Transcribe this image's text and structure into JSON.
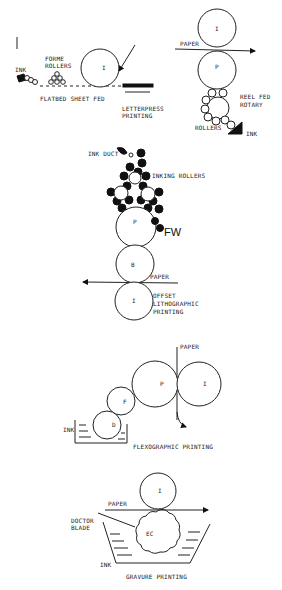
{
  "diagrams": {
    "letterpress": {
      "title_lines": [
        "LETTERPRESS",
        "PRINTING"
      ],
      "sub_label": "FLATBED SHEET FED",
      "ink_label": "INK",
      "forme_rollers_lines": [
        "FORME",
        "ROLLERS"
      ],
      "cylinder_label": "I"
    },
    "reel_fed": {
      "paper_label": "PAPER",
      "impression_label": "I",
      "plate_label": "P",
      "title_lines": [
        "REEL FED",
        "ROTARY"
      ],
      "rollers_label": "ROLLERS",
      "ink_label": "INK"
    },
    "offset": {
      "ink_duct_label": "INK DUCT",
      "inking_rollers_label": "INKING ROLLERS",
      "plate_label": "P",
      "fw_label": "FW",
      "blanket_label": "B",
      "paper_label": "PAPER",
      "impression_label": "I",
      "title_lines": [
        "OFFSET",
        "LITHOGRAPHIC",
        "PRINTING"
      ]
    },
    "flexographic": {
      "paper_label": "PAPER",
      "plate_label": "P",
      "impression_label": "I",
      "fountain_label": "F",
      "ductor_label": "D",
      "ink_label": "INK",
      "title": "FLEXOGRAPHIC PRINTING"
    },
    "gravure": {
      "impression_label": "I",
      "paper_label": "PAPER",
      "doctor_blade_lines": [
        "DOCTOR",
        "BLADE"
      ],
      "engraved_cylinder_label": "EC",
      "ink_label": "INK",
      "title": "GRAVURE PRINTING"
    }
  }
}
